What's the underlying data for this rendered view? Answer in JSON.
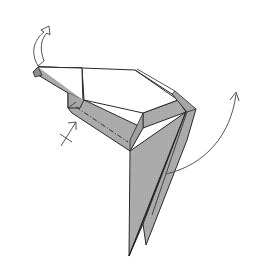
{
  "figure": {
    "type": "origami-folding-step",
    "description": "Origami model (bird/crane-like form) showing folding instructions",
    "colors": {
      "background": "#ffffff",
      "paper_shaded": "#a9a9a9",
      "paper_shaded_dark": "#9a9a9a",
      "paper_white": "#ffffff",
      "line": "#2a2a2a",
      "arrow": "#555555"
    },
    "symbols": [
      {
        "name": "pull-out-arrow",
        "kind": "hollow-curved-arrow",
        "location": "upper-left",
        "meaning": "pull / unfold upward"
      },
      {
        "name": "hidden-fold-arrow",
        "kind": "crossed-arrow",
        "location": "left-middle",
        "meaning": "fold behind / inside"
      },
      {
        "name": "swing-arrow",
        "kind": "curved-arrow",
        "location": "right",
        "meaning": "swing flap upward and outward"
      }
    ],
    "lines": [
      {
        "name": "mountain-fold-line",
        "kind": "dash-dot",
        "location": "along lower edge of neck"
      }
    ]
  }
}
